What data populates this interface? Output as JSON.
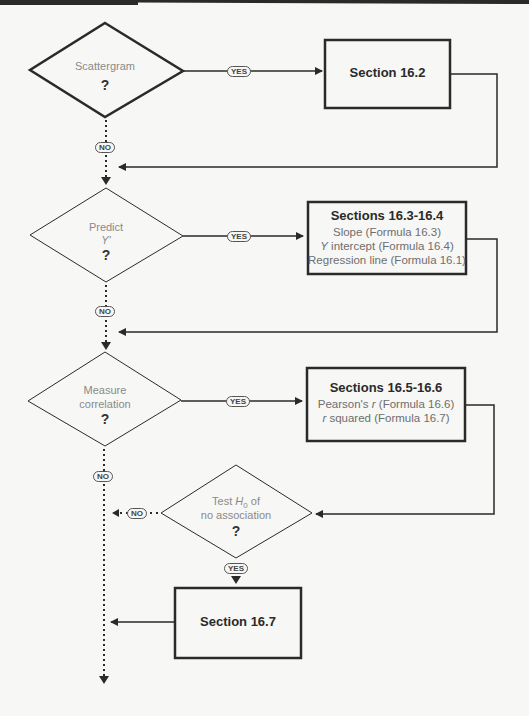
{
  "decisions": [
    {
      "id": "scattergram",
      "label_lines": [
        "Scattergram"
      ],
      "question": "?"
    },
    {
      "id": "predict",
      "label_lines": [
        "Predict"
      ],
      "italic_line": "Y'",
      "question": "?"
    },
    {
      "id": "measure",
      "label_lines": [
        "Measure",
        "correlation"
      ],
      "question": "?"
    },
    {
      "id": "test",
      "label_prefix": "Test ",
      "label_var": "H",
      "label_sub": "0",
      "label_suffix": " of",
      "label_line2": "no association",
      "question": "?"
    }
  ],
  "boxes": [
    {
      "id": "s16_2",
      "title": "Section 16.2",
      "lines": []
    },
    {
      "id": "s16_3_4",
      "title": "Sections 16.3-16.4",
      "lines": [
        "Slope (Formula 16.3)",
        "intercept (Formula 16.4)",
        "Regression line (Formula 16.1)"
      ],
      "line2_italic_prefix": "Y"
    },
    {
      "id": "s16_5_6",
      "title": "Sections 16.5-16.6",
      "line1_prefix": "Pearson's ",
      "line1_var": "r",
      "line1_suffix": " (Formula 16.6)",
      "line2_var": "r",
      "line2_suffix": " squared (Formula 16.7)"
    },
    {
      "id": "s16_7",
      "title": "Section 16.7",
      "lines": []
    }
  ],
  "pills": {
    "yes": "YES",
    "no": "NO"
  },
  "colors": {
    "stroke": "#2a2a2a",
    "label_gray": "#8a8a8a",
    "background": "#f7f7f5"
  }
}
